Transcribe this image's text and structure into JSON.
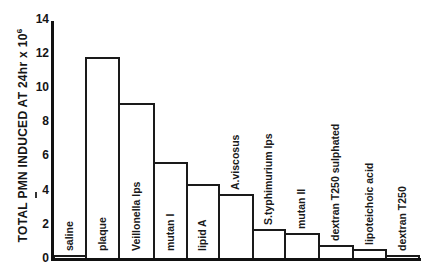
{
  "chart_data": {
    "type": "bar",
    "title": "",
    "xlabel": "",
    "ylabel": "TOTAL PMN INDUCED AT 24hr x 10",
    "ylabel_superscript": "6",
    "ylim": [
      0,
      14
    ],
    "yticks": [
      0,
      2,
      4,
      6,
      8,
      10,
      12,
      14
    ],
    "grid": false,
    "legend": null,
    "categories": [
      "saline",
      "plaque",
      "Veillonella lps",
      "mutan I",
      "lipid A",
      "A.viscosus",
      "S.typhimurium lps",
      "mutan II",
      "dextran T250 sulphated",
      "lipoteichoic acid",
      "dextran T250"
    ],
    "values": [
      0.2,
      11.8,
      9.1,
      5.7,
      4.4,
      3.8,
      1.75,
      1.5,
      0.8,
      0.6,
      0.2
    ]
  },
  "axis": {
    "ytick_labels": [
      "0",
      "2",
      "4",
      "6",
      "8",
      "10",
      "12",
      "14"
    ]
  }
}
